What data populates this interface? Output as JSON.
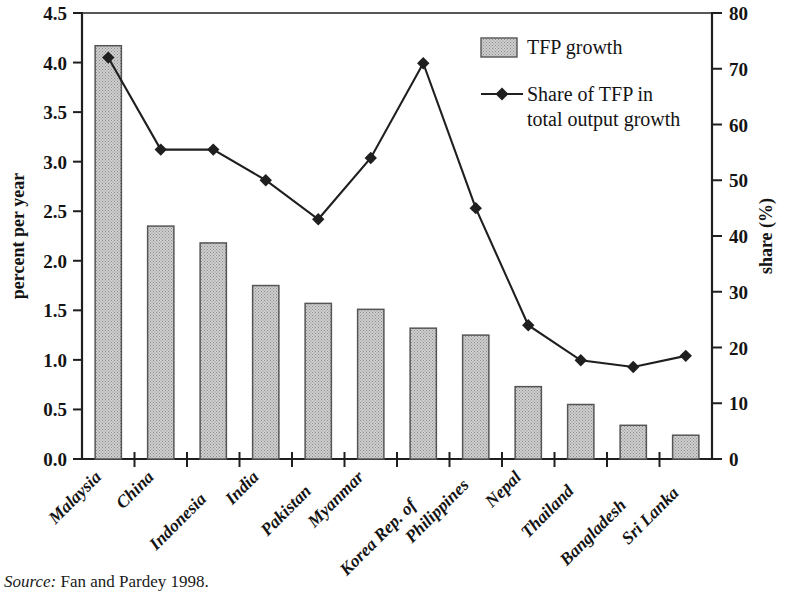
{
  "figure": {
    "source_note_label": "Source:",
    "source_note_text": " Fan and Pardey 1998."
  },
  "chart_data": {
    "type": "bar",
    "title": "",
    "subtitle": "",
    "xlabel": "",
    "ylabel": "percent per year",
    "y2label": "share (%)",
    "ylim": [
      0,
      4.5
    ],
    "y2lim": [
      0,
      80
    ],
    "yticks": [
      "0.0",
      "0.5",
      "1.0",
      "1.5",
      "2.0",
      "2.5",
      "3.0",
      "3.5",
      "4.0",
      "4.5"
    ],
    "ytick_values": [
      0,
      0.5,
      1.0,
      1.5,
      2.0,
      2.5,
      3.0,
      3.5,
      4.0,
      4.5
    ],
    "y2ticks": [
      "0",
      "10",
      "20",
      "30",
      "40",
      "50",
      "60",
      "70",
      "80"
    ],
    "y2tick_values": [
      0,
      10,
      20,
      30,
      40,
      50,
      60,
      70,
      80
    ],
    "grid": false,
    "legend_position": "top-right",
    "categories": [
      "Malaysia",
      "China",
      "Indonesia",
      "India",
      "Pakistan",
      "Myanmar",
      "Korea Rep. of",
      "Philippines",
      "Nepal",
      "Thailand",
      "Bangladesh",
      "Sri Lanka"
    ],
    "series": [
      {
        "name": "TFP growth",
        "type": "bar",
        "axis": "left",
        "unit": "percent per year",
        "values": [
          4.17,
          2.35,
          2.18,
          1.75,
          1.57,
          1.51,
          1.32,
          1.25,
          0.73,
          0.55,
          0.34,
          0.24
        ]
      },
      {
        "name": "Share of TFP in total output growth",
        "type": "line",
        "axis": "right",
        "unit": "share (%)",
        "values": [
          72,
          55.5,
          55.5,
          50,
          43,
          54,
          71,
          45,
          24,
          17.7,
          16.5,
          18.5
        ]
      }
    ],
    "legend": [
      {
        "label": "TFP growth",
        "marker": "filled-box"
      },
      {
        "label": "Share of TFP in",
        "label2": "total output growth",
        "marker": "line-diamond"
      }
    ],
    "colors": {
      "bar_fill": "#bdbdbd",
      "bar_edge": "#555555",
      "line": "#1f1f1f",
      "marker": "#1f1f1f",
      "axis": "#1f1f1f",
      "text": "#141414"
    }
  }
}
